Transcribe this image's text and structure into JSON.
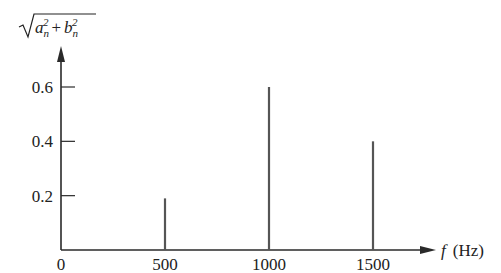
{
  "chart_data": {
    "type": "bar",
    "subtype": "stem / line spectrum",
    "title": "",
    "xlabel": "f (Hz)",
    "ylabel": "sqrt(a_n^2 + b_n^2)",
    "x": [
      500,
      1000,
      1500
    ],
    "values": [
      0.19,
      0.6,
      0.4
    ],
    "x_ticks": [
      "0",
      "500",
      "1000",
      "1500"
    ],
    "x_tick_values": [
      0,
      500,
      1000,
      1500
    ],
    "y_ticks": [
      "0.2",
      "0.4",
      "0.6"
    ],
    "y_tick_values": [
      0.2,
      0.4,
      0.6
    ],
    "xlim": [
      0,
      1800
    ],
    "ylim": [
      0,
      0.75
    ],
    "grid": false,
    "legend": null
  },
  "labels": {
    "x_axis_var": "f",
    "x_axis_unit": "(Hz)",
    "y_axis_a": "a",
    "y_axis_b": "b",
    "y_axis_sub": "n",
    "y_axis_sup": "2",
    "y_axis_plus": "+"
  },
  "colors": {
    "axis": "#2a2a2a",
    "stem": "#555555"
  }
}
